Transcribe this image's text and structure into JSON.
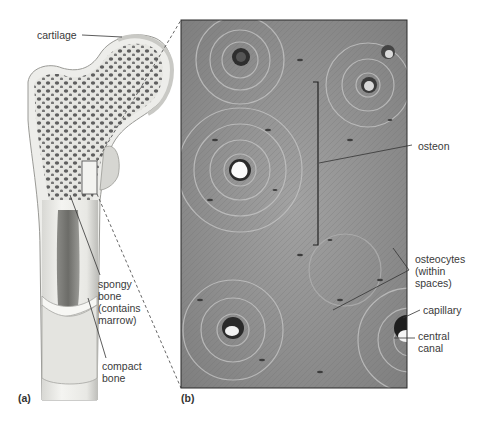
{
  "figure": {
    "panel_a": {
      "label": "(a)",
      "subject": "femur cross-section illustration",
      "callouts": {
        "cartilage": "cartilage",
        "spongy_bone": "spongy\nbone\n(contains\nmarrow)",
        "compact_bone": "compact\nbone"
      }
    },
    "panel_b": {
      "label": "(b)",
      "subject": "micrograph of compact bone",
      "callouts": {
        "osteon": "osteon",
        "osteocytes": "osteocytes\n(within\nspaces)",
        "capillary": "capillary",
        "central_canal": "central\ncanal"
      }
    }
  },
  "colors": {
    "background": "#ffffff",
    "bone_fill": "#eeeeea",
    "bone_shadow": "#b9b9b5",
    "spongy_holes": "#6a6a6a",
    "micrograph_base": "#8e8e8e",
    "leader_line": "#333333"
  }
}
